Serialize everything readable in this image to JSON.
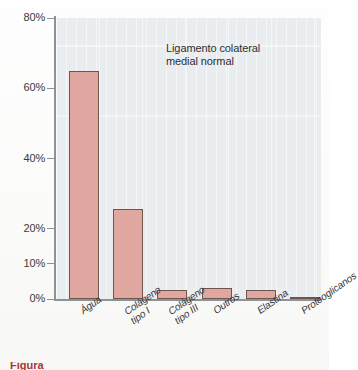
{
  "chart_data": {
    "type": "bar",
    "title": "",
    "annotation": "Ligamento colateral\nmedial normal",
    "annotation_lines": [
      "Ligamento colateral",
      "medial normal"
    ],
    "xlabel": "",
    "ylabel": "",
    "ylim": [
      0,
      80
    ],
    "yunit": "%",
    "grid": true,
    "grid_orientation": "vertical",
    "legend": "none",
    "categories": [
      "Água",
      "Colágeno\ntipo I",
      "Colágeno\ntipo III",
      "Outros",
      "Elastina",
      "Proteoglicanos"
    ],
    "category_lines": [
      [
        "Água"
      ],
      [
        "Colágeno",
        "tipo I"
      ],
      [
        "Colágeno",
        "tipo III"
      ],
      [
        "Outros"
      ],
      [
        "Elastina"
      ],
      [
        "Proteoglicanos"
      ]
    ],
    "values": [
      65,
      25.5,
      2.5,
      3,
      2.5,
      0.7
    ],
    "ytick_values": [
      0,
      10,
      20,
      40,
      60,
      80
    ],
    "ytick_labels": [
      "0%",
      "10%",
      "20%",
      "40%",
      "60%",
      "80%"
    ],
    "bar_color": "#dfa79f",
    "bar_edge_color": "#6e564f",
    "plot_background": "#e9edef",
    "axis_color": "#8d9295",
    "text_color": "#343434"
  },
  "caption": {
    "figure_label": "Figura",
    "figure_text": ""
  }
}
